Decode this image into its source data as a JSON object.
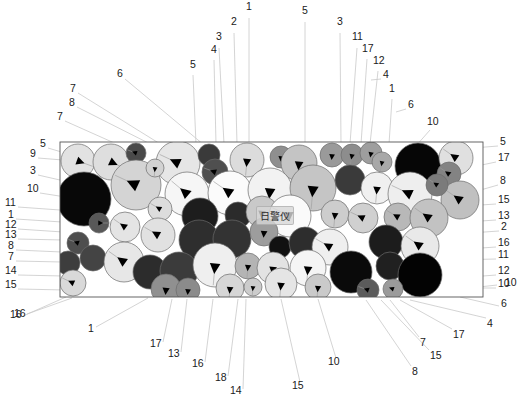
{
  "figure": {
    "title_caption": "",
    "watermark_text": "日警仪",
    "frame": {
      "x": 60,
      "y": 142,
      "width": 423,
      "height": 155,
      "stroke": "#555555",
      "fill": "#ffffff"
    },
    "background_color": "#ffffff",
    "leader_line_color": "#c9c9c9",
    "label_text_color": "#1a1a1a"
  },
  "legend_note": "Patent-style schematic: randomly packed spherical particles of varying grayscale shades inside a rectangular domain, each with an internal directional arrow marker; numbered reference leader lines radiate to the figure edges.",
  "palette": {
    "shades": [
      "#ffffff",
      "#f4f4f4",
      "#e8e8e8",
      "#d9d9d9",
      "#c8c8c8",
      "#b0b0b0",
      "#9a9a9a",
      "#808080",
      "#5e5e5e",
      "#3c3c3c",
      "#2a2a2a",
      "#111111",
      "#000000"
    ],
    "outline": "#6b6b6b",
    "arrow": "#000000"
  },
  "labels_top": [
    {
      "text": "1",
      "x": 246,
      "y": 6,
      "lx": 249,
      "ly": 18,
      "tx": 249,
      "ty": 144
    },
    {
      "text": "2",
      "x": 231,
      "y": 21,
      "lx": 234,
      "ly": 33,
      "tx": 237,
      "ty": 144
    },
    {
      "text": "3",
      "x": 216,
      "y": 36,
      "lx": 219,
      "ly": 48,
      "tx": 224,
      "ty": 144
    },
    {
      "text": "4",
      "x": 211,
      "y": 49,
      "lx": 214,
      "ly": 60,
      "tx": 216,
      "ty": 144
    },
    {
      "text": "5",
      "x": 190,
      "y": 64,
      "lx": 193,
      "ly": 75,
      "tx": 196,
      "ty": 144
    },
    {
      "text": "5",
      "x": 302,
      "y": 10,
      "lx": 305,
      "ly": 22,
      "tx": 305,
      "ty": 144
    },
    {
      "text": "3",
      "x": 337,
      "y": 21,
      "lx": 340,
      "ly": 33,
      "tx": 341,
      "ty": 144
    },
    {
      "text": "11",
      "x": 352,
      "y": 36,
      "lx": 357,
      "ly": 48,
      "tx": 350,
      "ty": 144
    },
    {
      "text": "17",
      "x": 362,
      "y": 48,
      "lx": 367,
      "ly": 59,
      "tx": 361,
      "ty": 144
    },
    {
      "text": "12",
      "x": 373,
      "y": 60,
      "lx": 378,
      "ly": 71,
      "tx": 370,
      "ty": 144
    },
    {
      "text": "4",
      "x": 383,
      "y": 74,
      "lx": 381,
      "ly": 79,
      "tx": 371,
      "ty": 80
    },
    {
      "text": "1",
      "x": 389,
      "y": 88,
      "lx": 392,
      "ly": 99,
      "tx": 389,
      "ty": 144
    },
    {
      "text": "6",
      "x": 408,
      "y": 104,
      "lx": 406,
      "ly": 109,
      "tx": 396,
      "ty": 112
    },
    {
      "text": "10",
      "x": 427,
      "y": 121,
      "lx": 430,
      "ly": 130,
      "tx": 415,
      "ty": 147
    },
    {
      "text": "6",
      "x": 117,
      "y": 73,
      "lx": 125,
      "ly": 79,
      "tx": 210,
      "ty": 150
    },
    {
      "text": "7",
      "x": 70,
      "y": 88,
      "lx": 78,
      "ly": 93,
      "tx": 178,
      "ty": 155
    },
    {
      "text": "8",
      "x": 69,
      "y": 102,
      "lx": 77,
      "ly": 107,
      "tx": 178,
      "ty": 158
    },
    {
      "text": "7",
      "x": 57,
      "y": 116,
      "lx": 65,
      "ly": 121,
      "tx": 130,
      "ty": 150
    }
  ],
  "labels_left": [
    {
      "text": "5",
      "x": 40,
      "y": 143,
      "lx": 48,
      "ly": 148,
      "tx": 75,
      "ty": 156
    },
    {
      "text": "9",
      "x": 30,
      "y": 153,
      "lx": 38,
      "ly": 158,
      "tx": 100,
      "ty": 163
    },
    {
      "text": "3",
      "x": 30,
      "y": 170,
      "lx": 38,
      "ly": 175,
      "tx": 95,
      "ty": 188
    },
    {
      "text": "10",
      "x": 27,
      "y": 188,
      "lx": 40,
      "ly": 193,
      "tx": 85,
      "ty": 200
    },
    {
      "text": "11",
      "x": 5,
      "y": 202,
      "lx": 18,
      "ly": 207,
      "tx": 60,
      "ty": 210
    },
    {
      "text": "1",
      "x": 8,
      "y": 214,
      "lx": 16,
      "ly": 219,
      "tx": 62,
      "ty": 222
    },
    {
      "text": "12",
      "x": 5,
      "y": 224,
      "lx": 18,
      "ly": 229,
      "tx": 63,
      "ty": 232
    },
    {
      "text": "13",
      "x": 5,
      "y": 234,
      "lx": 18,
      "ly": 239,
      "tx": 63,
      "ty": 240
    },
    {
      "text": "8",
      "x": 8,
      "y": 245,
      "lx": 16,
      "ly": 250,
      "tx": 62,
      "ty": 252
    },
    {
      "text": "7",
      "x": 8,
      "y": 256,
      "lx": 16,
      "ly": 261,
      "tx": 62,
      "ty": 262
    },
    {
      "text": "14",
      "x": 5,
      "y": 270,
      "lx": 18,
      "ly": 275,
      "tx": 63,
      "ty": 276
    },
    {
      "text": "15",
      "x": 5,
      "y": 284,
      "lx": 18,
      "ly": 289,
      "tx": 66,
      "ty": 290
    },
    {
      "text": "16",
      "x": 10,
      "y": 314,
      "lx": 23,
      "ly": 316,
      "tx": 66,
      "ty": 297
    }
  ],
  "labels_right": [
    {
      "text": "5",
      "x": 500,
      "y": 141,
      "lx": 498,
      "ly": 146,
      "tx": 448,
      "ty": 150
    },
    {
      "text": "17",
      "x": 498,
      "y": 157,
      "lx": 496,
      "ly": 162,
      "tx": 448,
      "ty": 172
    },
    {
      "text": "8",
      "x": 500,
      "y": 180,
      "lx": 498,
      "ly": 185,
      "tx": 470,
      "ty": 193
    },
    {
      "text": "15",
      "x": 498,
      "y": 199,
      "lx": 496,
      "ly": 204,
      "tx": 465,
      "ty": 206
    },
    {
      "text": "13",
      "x": 498,
      "y": 215,
      "lx": 496,
      "ly": 220,
      "tx": 466,
      "ty": 222
    },
    {
      "text": "2",
      "x": 501,
      "y": 226,
      "lx": 499,
      "ly": 231,
      "tx": 470,
      "ty": 233
    },
    {
      "text": "16",
      "x": 498,
      "y": 242,
      "lx": 496,
      "ly": 247,
      "tx": 452,
      "ty": 250
    },
    {
      "text": "11",
      "x": 498,
      "y": 254,
      "lx": 496,
      "ly": 259,
      "tx": 452,
      "ty": 260
    },
    {
      "text": "12",
      "x": 498,
      "y": 270,
      "lx": 496,
      "ly": 275,
      "tx": 470,
      "ty": 277
    },
    {
      "text": "10",
      "x": 498,
      "y": 283,
      "lx": 496,
      "ly": 288,
      "tx": 470,
      "ty": 288
    },
    {
      "text": "6",
      "x": 501,
      "y": 303,
      "lx": 499,
      "ly": 306,
      "tx": 460,
      "ty": 297
    }
  ],
  "labels_bottom": [
    {
      "text": "16",
      "x": 14,
      "y": 313,
      "lx": 27,
      "ly": 314,
      "tx": 72,
      "ty": 298
    },
    {
      "text": "1",
      "x": 88,
      "y": 328,
      "lx": 96,
      "ly": 327,
      "tx": 148,
      "ty": 298
    },
    {
      "text": "17",
      "x": 150,
      "y": 343,
      "lx": 163,
      "ly": 342,
      "tx": 172,
      "ty": 299
    },
    {
      "text": "13",
      "x": 168,
      "y": 353,
      "lx": 181,
      "ly": 352,
      "tx": 187,
      "ty": 299
    },
    {
      "text": "16",
      "x": 192,
      "y": 363,
      "lx": 205,
      "ly": 362,
      "tx": 213,
      "ty": 299
    },
    {
      "text": "18",
      "x": 215,
      "y": 377,
      "lx": 228,
      "ly": 376,
      "tx": 238,
      "ty": 299
    },
    {
      "text": "14",
      "x": 230,
      "y": 390,
      "lx": 243,
      "ly": 389,
      "tx": 246,
      "ty": 299
    },
    {
      "text": "15",
      "x": 292,
      "y": 385,
      "lx": 300,
      "ly": 382,
      "tx": 281,
      "ty": 299
    },
    {
      "text": "10",
      "x": 328,
      "y": 361,
      "lx": 336,
      "ly": 358,
      "tx": 318,
      "ty": 299
    },
    {
      "text": "8",
      "x": 412,
      "y": 371,
      "lx": 411,
      "ly": 366,
      "tx": 366,
      "ty": 300
    },
    {
      "text": "15",
      "x": 430,
      "y": 355,
      "lx": 429,
      "ly": 350,
      "tx": 381,
      "ty": 300
    },
    {
      "text": "7",
      "x": 420,
      "y": 342,
      "lx": 419,
      "ly": 337,
      "tx": 390,
      "ty": 300
    },
    {
      "text": "17",
      "x": 453,
      "y": 334,
      "lx": 452,
      "ly": 329,
      "tx": 400,
      "ty": 300
    },
    {
      "text": "4",
      "x": 487,
      "y": 323,
      "lx": 486,
      "ly": 318,
      "tx": 410,
      "ty": 300
    },
    {
      "text": "10",
      "x": 505,
      "y": 282,
      "lx": 497,
      "ly": 285,
      "tx": 470,
      "ty": 288
    }
  ],
  "particles": [
    {
      "cx": 78,
      "cy": 161,
      "r": 17,
      "shade": "#e2e2e2",
      "ang": 20
    },
    {
      "cx": 111,
      "cy": 162,
      "r": 18,
      "shade": "#dedede",
      "ang": 25
    },
    {
      "cx": 136,
      "cy": 153,
      "r": 10,
      "shade": "#4a4a4a",
      "ang": 200
    },
    {
      "cx": 178,
      "cy": 163,
      "r": 22,
      "shade": "#e6e6e6",
      "ang": 205
    },
    {
      "cx": 209,
      "cy": 155,
      "r": 11,
      "shade": "#3a3a3a",
      "ang": 190
    },
    {
      "cx": 215,
      "cy": 172,
      "r": 13,
      "shade": "#4f4f4f",
      "ang": 200
    },
    {
      "cx": 247,
      "cy": 160,
      "r": 17,
      "shade": "#dcdcdc",
      "ang": 95
    },
    {
      "cx": 281,
      "cy": 157,
      "r": 11,
      "shade": "#8f8f8f",
      "ang": 95
    },
    {
      "cx": 299,
      "cy": 163,
      "r": 18,
      "shade": "#c4c4c4",
      "ang": 95
    },
    {
      "cx": 332,
      "cy": 155,
      "r": 12,
      "shade": "#9a9a9a",
      "ang": 95
    },
    {
      "cx": 352,
      "cy": 155,
      "r": 11,
      "shade": "#8d8d8d",
      "ang": 100
    },
    {
      "cx": 371,
      "cy": 153,
      "r": 11,
      "shade": "#9e9e9e",
      "ang": 100
    },
    {
      "cx": 382,
      "cy": 162,
      "r": 10,
      "shade": "#a8a8a8",
      "ang": 100
    },
    {
      "cx": 418,
      "cy": 166,
      "r": 23,
      "shade": "#060606",
      "ang": 0
    },
    {
      "cx": 456,
      "cy": 158,
      "r": 17,
      "shade": "#e0e0e0",
      "ang": 215
    },
    {
      "cx": 136,
      "cy": 185,
      "r": 25,
      "shade": "#d4d4d4",
      "ang": 205
    },
    {
      "cx": 84,
      "cy": 199,
      "r": 27,
      "shade": "#080808",
      "ang": 0
    },
    {
      "cx": 187,
      "cy": 194,
      "r": 22,
      "shade": "#f6f6f6",
      "ang": 220
    },
    {
      "cx": 230,
      "cy": 193,
      "r": 22,
      "shade": "#fbfbfb",
      "ang": 215
    },
    {
      "cx": 270,
      "cy": 190,
      "r": 22,
      "shade": "#f2f2f2",
      "ang": 95
    },
    {
      "cx": 313,
      "cy": 188,
      "r": 23,
      "shade": "#c5c5c5",
      "ang": 95
    },
    {
      "cx": 350,
      "cy": 180,
      "r": 15,
      "shade": "#3a3a3a",
      "ang": 95
    },
    {
      "cx": 377,
      "cy": 188,
      "r": 16,
      "shade": "#f0f0f0",
      "ang": 95
    },
    {
      "cx": 410,
      "cy": 194,
      "r": 22,
      "shade": "#eeeeee",
      "ang": 205
    },
    {
      "cx": 449,
      "cy": 174,
      "r": 12,
      "shade": "#838383",
      "ang": 215
    },
    {
      "cx": 460,
      "cy": 200,
      "r": 19,
      "shade": "#c0c0c0",
      "ang": 215
    },
    {
      "cx": 160,
      "cy": 209,
      "r": 12,
      "shade": "#dddddd",
      "ang": 210
    },
    {
      "cx": 200,
      "cy": 216,
      "r": 18,
      "shade": "#1d1d1d",
      "ang": 0
    },
    {
      "cx": 238,
      "cy": 215,
      "r": 13,
      "shade": "#2b2b2b",
      "ang": 0
    },
    {
      "cx": 262,
      "cy": 212,
      "r": 16,
      "shade": "#c9c9c9",
      "ang": 95
    },
    {
      "cx": 290,
      "cy": 216,
      "r": 21,
      "shade": "#fafafa",
      "ang": 205
    },
    {
      "cx": 335,
      "cy": 214,
      "r": 14,
      "shade": "#cdcdcd",
      "ang": 95
    },
    {
      "cx": 363,
      "cy": 218,
      "r": 15,
      "shade": "#d0d0d0",
      "ang": 205
    },
    {
      "cx": 398,
      "cy": 217,
      "r": 14,
      "shade": "#b8b8b8",
      "ang": 210
    },
    {
      "cx": 429,
      "cy": 218,
      "r": 19,
      "shade": "#c2c2c2",
      "ang": 215
    },
    {
      "cx": 99,
      "cy": 223,
      "r": 10,
      "shade": "#585858",
      "ang": 0
    },
    {
      "cx": 125,
      "cy": 227,
      "r": 15,
      "shade": "#e4e4e4",
      "ang": 215
    },
    {
      "cx": 158,
      "cy": 235,
      "r": 17,
      "shade": "#e1e1e1",
      "ang": 210
    },
    {
      "cx": 199,
      "cy": 240,
      "r": 20,
      "shade": "#2e2e2e",
      "ang": 0
    },
    {
      "cx": 232,
      "cy": 239,
      "r": 19,
      "shade": "#333333",
      "ang": 0
    },
    {
      "cx": 264,
      "cy": 232,
      "r": 14,
      "shade": "#9d9d9d",
      "ang": 95
    },
    {
      "cx": 280,
      "cy": 247,
      "r": 11,
      "shade": "#111111",
      "ang": 0
    },
    {
      "cx": 305,
      "cy": 243,
      "r": 16,
      "shade": "#2d2d2d",
      "ang": 0
    },
    {
      "cx": 330,
      "cy": 247,
      "r": 18,
      "shade": "#efefef",
      "ang": 210
    },
    {
      "cx": 386,
      "cy": 242,
      "r": 17,
      "shade": "#1c1c1c",
      "ang": 0
    },
    {
      "cx": 420,
      "cy": 246,
      "r": 19,
      "shade": "#e9e9e9",
      "ang": 215
    },
    {
      "cx": 78,
      "cy": 243,
      "r": 11,
      "shade": "#4e4e4e",
      "ang": 200
    },
    {
      "cx": 68,
      "cy": 263,
      "r": 12,
      "shade": "#3d3d3d",
      "ang": 0
    },
    {
      "cx": 93,
      "cy": 258,
      "r": 13,
      "shade": "#444444",
      "ang": 95
    },
    {
      "cx": 124,
      "cy": 262,
      "r": 20,
      "shade": "#e7e7e7",
      "ang": 215
    },
    {
      "cx": 150,
      "cy": 272,
      "r": 17,
      "shade": "#2c2c2c",
      "ang": 0
    },
    {
      "cx": 179,
      "cy": 271,
      "r": 19,
      "shade": "#3b3b3b",
      "ang": 0
    },
    {
      "cx": 215,
      "cy": 265,
      "r": 22,
      "shade": "#efefef",
      "ang": 95
    },
    {
      "cx": 248,
      "cy": 266,
      "r": 13,
      "shade": "#b4b4b4",
      "ang": 95
    },
    {
      "cx": 273,
      "cy": 268,
      "r": 16,
      "shade": "#e3e3e3",
      "ang": 95
    },
    {
      "cx": 308,
      "cy": 268,
      "r": 18,
      "shade": "#f5f5f5",
      "ang": 95
    },
    {
      "cx": 351,
      "cy": 272,
      "r": 21,
      "shade": "#0a0a0a",
      "ang": 0
    },
    {
      "cx": 390,
      "cy": 266,
      "r": 14,
      "shade": "#202020",
      "ang": 0
    },
    {
      "cx": 420,
      "cy": 275,
      "r": 22,
      "shade": "#030303",
      "ang": 0
    },
    {
      "cx": 73,
      "cy": 283,
      "r": 13,
      "shade": "#d9d9d9",
      "ang": 205
    },
    {
      "cx": 166,
      "cy": 289,
      "r": 15,
      "shade": "#909090",
      "ang": 95
    },
    {
      "cx": 188,
      "cy": 290,
      "r": 12,
      "shade": "#8b8b8b",
      "ang": 95
    },
    {
      "cx": 230,
      "cy": 288,
      "r": 14,
      "shade": "#d6d6d6",
      "ang": 95
    },
    {
      "cx": 253,
      "cy": 287,
      "r": 9,
      "shade": "#cccccc",
      "ang": 95
    },
    {
      "cx": 281,
      "cy": 284,
      "r": 16,
      "shade": "#e5e5e5",
      "ang": 95
    },
    {
      "cx": 318,
      "cy": 287,
      "r": 13,
      "shade": "#cacaca",
      "ang": 95
    },
    {
      "cx": 368,
      "cy": 290,
      "r": 11,
      "shade": "#5b5b5b",
      "ang": 200
    },
    {
      "cx": 393,
      "cy": 289,
      "r": 10,
      "shade": "#9b9b9b",
      "ang": 200
    },
    {
      "cx": 155,
      "cy": 168,
      "r": 9,
      "shade": "#d2d2d2",
      "ang": 95
    },
    {
      "cx": 437,
      "cy": 185,
      "r": 11,
      "shade": "#7b7b7b",
      "ang": 215
    }
  ]
}
